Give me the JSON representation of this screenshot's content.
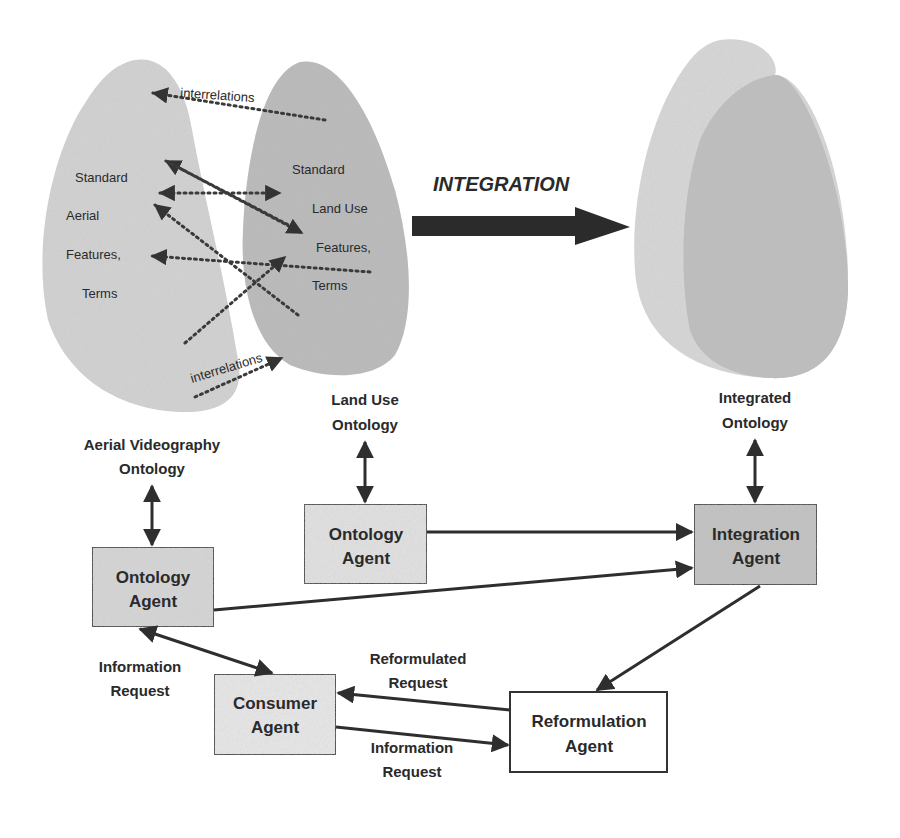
{
  "diagram": {
    "integration_label": "INTEGRATION",
    "colors": {
      "background": "#ffffff",
      "blob_light": "#d4d4d4",
      "blob_dark": "#b8b8b8",
      "box_light": "#e6e6e6",
      "box_mid": "#d9d9d9",
      "box_dark": "#c4c4c4",
      "box_white": "#ffffff",
      "line": "#2e2e2e"
    },
    "left_ontology": {
      "terms": [
        "Standard",
        "Aerial",
        "Features,",
        "Terms"
      ],
      "label_line1": "Aerial Videography",
      "label_line2": "Ontology"
    },
    "middle_ontology": {
      "terms": [
        "Standard",
        "Land Use",
        "Features,",
        "Terms"
      ],
      "label_line1": "Land Use",
      "label_line2": "Ontology"
    },
    "integrated_ontology": {
      "label_line1": "Integrated",
      "label_line2": "Ontology"
    },
    "interrelations": {
      "top": "interrelations",
      "bottom": "interrelations"
    },
    "agents": {
      "left_ontology_agent": {
        "line1": "Ontology",
        "line2": "Agent"
      },
      "middle_ontology_agent": {
        "line1": "Ontology",
        "line2": "Agent"
      },
      "integration_agent": {
        "line1": "Integration",
        "line2": "Agent"
      },
      "consumer_agent": {
        "line1": "Consumer",
        "line2": "Agent"
      },
      "reformulation_agent": {
        "line1": "Reformulation",
        "line2": "Agent"
      }
    },
    "edge_labels": {
      "info_request_left": {
        "line1": "Information",
        "line2": "Request"
      },
      "reformulated_request": {
        "line1": "Reformulated",
        "line2": "Request"
      },
      "info_request_bottom": {
        "line1": "Information",
        "line2": "Request"
      }
    }
  }
}
